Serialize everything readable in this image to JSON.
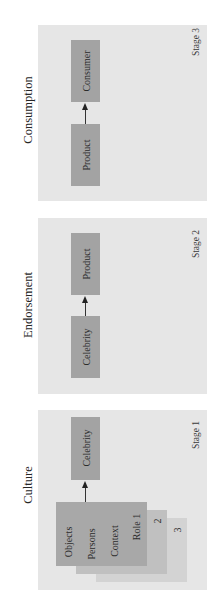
{
  "diagram": {
    "orientation": "rotated-90-ccw",
    "stages": [
      {
        "id": "stage3",
        "title": "Consumption",
        "stage_label": "Stage 3",
        "nodes": [
          "Product",
          "Consumer"
        ],
        "edge": {
          "from": "Product",
          "to": "Consumer"
        }
      },
      {
        "id": "stage2",
        "title": "Endorsement",
        "stage_label": "Stage 2",
        "nodes": [
          "Celebrity",
          "Product"
        ],
        "edge": {
          "from": "Celebrity",
          "to": "Product"
        }
      },
      {
        "id": "stage1",
        "title": "Culture",
        "stage_label": "Stage 1",
        "role_card": {
          "items": [
            "Objects",
            "Persons",
            "Context",
            "Role 1"
          ],
          "stack_labels": [
            "2",
            "3"
          ]
        },
        "target": "Celebrity",
        "edge": {
          "from": "Role cards",
          "to": "Celebrity"
        }
      }
    ]
  },
  "colors": {
    "panel": "#e6e6e6",
    "box": "#a3a3a3",
    "card1": "#a8a8a8",
    "card2": "#c0c0c0",
    "card3": "#d3d3d3",
    "arrow": "#222222"
  }
}
